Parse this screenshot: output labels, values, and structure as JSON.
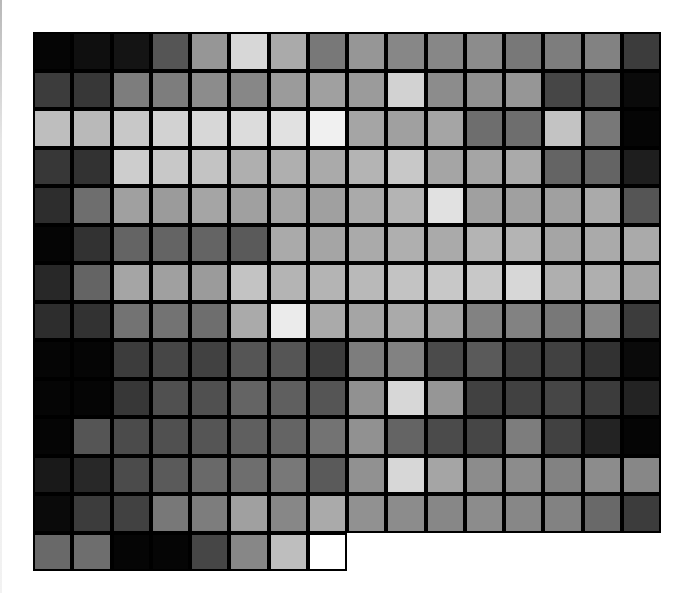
{
  "image": {
    "description": "Grayscale pixel-block mosaic grid",
    "rows": 14,
    "cols": 16,
    "cell_border_color": "#000000",
    "background_color": "#ffffff"
  },
  "grid": {
    "values": [
      [
        5,
        15,
        20,
        85,
        150,
        215,
        170,
        120,
        150,
        135,
        135,
        140,
        120,
        125,
        130,
        60
      ],
      [
        60,
        55,
        125,
        125,
        140,
        135,
        155,
        160,
        155,
        210,
        140,
        145,
        150,
        70,
        80,
        10
      ],
      [
        190,
        185,
        200,
        210,
        215,
        220,
        225,
        240,
        165,
        160,
        165,
        110,
        110,
        195,
        120,
        5
      ],
      [
        55,
        50,
        205,
        200,
        195,
        175,
        175,
        170,
        180,
        200,
        165,
        165,
        170,
        100,
        100,
        30
      ],
      [
        45,
        110,
        160,
        155,
        165,
        160,
        165,
        160,
        170,
        180,
        225,
        160,
        160,
        160,
        170,
        85
      ],
      [
        5,
        50,
        100,
        100,
        100,
        90,
        170,
        165,
        170,
        175,
        170,
        180,
        180,
        165,
        170,
        170
      ],
      [
        40,
        100,
        165,
        160,
        155,
        195,
        180,
        180,
        185,
        195,
        200,
        200,
        215,
        175,
        175,
        165
      ],
      [
        45,
        50,
        115,
        115,
        110,
        170,
        235,
        170,
        165,
        170,
        165,
        130,
        130,
        120,
        135,
        60
      ],
      [
        5,
        5,
        60,
        70,
        65,
        85,
        85,
        60,
        125,
        130,
        75,
        90,
        65,
        65,
        50,
        10
      ],
      [
        5,
        5,
        55,
        80,
        80,
        100,
        95,
        85,
        145,
        215,
        150,
        65,
        65,
        70,
        60,
        35
      ],
      [
        5,
        85,
        75,
        80,
        85,
        95,
        100,
        115,
        145,
        100,
        75,
        70,
        125,
        65,
        35,
        5
      ],
      [
        25,
        40,
        75,
        90,
        105,
        110,
        120,
        90,
        145,
        215,
        165,
        140,
        140,
        130,
        140,
        135
      ],
      [
        10,
        60,
        65,
        120,
        125,
        160,
        135,
        170,
        145,
        140,
        135,
        140,
        135,
        130,
        105,
        60
      ],
      [
        105,
        110,
        5,
        5,
        70,
        135,
        190,
        255
      ]
    ]
  }
}
